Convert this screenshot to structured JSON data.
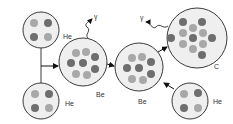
{
  "diagram": {
    "colors": {
      "outline": "#3a3a3a",
      "fill": "#efefef",
      "nucleon_light": "#a8a8a8",
      "nucleon_dark": "#6e6e6e"
    },
    "nodes": [
      {
        "id": "he-top",
        "label": "He",
        "cx": 41,
        "cy": 30,
        "r": 18
      },
      {
        "id": "he-bottom",
        "label": "He",
        "cx": 41,
        "cy": 101,
        "r": 18
      },
      {
        "id": "be-1",
        "label": "Be",
        "cx": 83,
        "cy": 62,
        "r": 24
      },
      {
        "id": "be-2",
        "label": "Be",
        "cx": 139,
        "cy": 67,
        "r": 24
      },
      {
        "id": "c",
        "label": "C",
        "cx": 197,
        "cy": 38,
        "r": 30
      },
      {
        "id": "he-right",
        "label": "He",
        "cx": 190,
        "cy": 101,
        "r": 18
      }
    ],
    "photons": [
      {
        "id": "gamma-1",
        "label": "γ"
      },
      {
        "id": "gamma-2",
        "label": "γ"
      }
    ]
  }
}
